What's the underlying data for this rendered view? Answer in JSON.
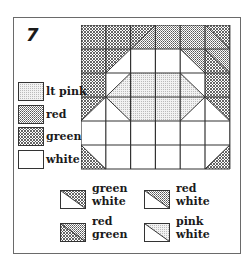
{
  "pattern": {
    "number": "7",
    "grid": {
      "cols": 6,
      "rows": 6
    }
  },
  "colors": {
    "green": "#2a2a2a",
    "red": "#5a5a5a",
    "lt_pink": "#c8c8c8",
    "white": "#ffffff",
    "line": "#333333"
  },
  "legend_solids": [
    {
      "key": "lt_pink",
      "label": "lt pink"
    },
    {
      "key": "red",
      "label": "red"
    },
    {
      "key": "green",
      "label": "green"
    },
    {
      "key": "white",
      "label": "white"
    }
  ],
  "legend_triangles": [
    {
      "upper": "green",
      "lower": "white",
      "line1": "green",
      "line2": "white"
    },
    {
      "upper": "red",
      "lower": "white",
      "line1": "red",
      "line2": "white"
    },
    {
      "upper": "red",
      "lower": "green",
      "line1": "red",
      "line2": "green"
    },
    {
      "upper": "lt_pink",
      "lower": "white",
      "line1": "pink",
      "line2": "white"
    }
  ],
  "quilt_cells": [
    [
      "green",
      "green",
      {
        "diag": "/",
        "a": "green",
        "b": "red"
      },
      "red",
      "red",
      {
        "diag": "\\",
        "a": "green",
        "b": "red"
      }
    ],
    [
      "green",
      {
        "diag": "/",
        "a": "green",
        "b": "white"
      },
      "white",
      "white",
      {
        "diag": "\\",
        "a": "red",
        "b": "white"
      },
      {
        "diag": "\\",
        "a": "red",
        "b": "green"
      }
    ],
    [
      "green",
      {
        "diag": "/",
        "a": "white",
        "b": "lt_pink"
      },
      "lt_pink",
      "lt_pink",
      {
        "diag": "\\",
        "a": "white",
        "b": "lt_pink"
      },
      "green"
    ],
    [
      {
        "diag": "/",
        "a": "green",
        "b": "white"
      },
      {
        "diag": "\\",
        "a": "lt_pink",
        "b": "white"
      },
      "lt_pink",
      "lt_pink",
      {
        "diag": "/",
        "a": "lt_pink",
        "b": "white"
      },
      {
        "diag": "\\",
        "a": "green",
        "b": "white"
      }
    ],
    [
      "white",
      "white",
      "white",
      "white",
      "white",
      "white"
    ],
    [
      {
        "diag": "\\",
        "a": "white",
        "b": "green"
      },
      "white",
      "white",
      "white",
      "white",
      {
        "diag": "/",
        "a": "white",
        "b": "green"
      }
    ]
  ]
}
